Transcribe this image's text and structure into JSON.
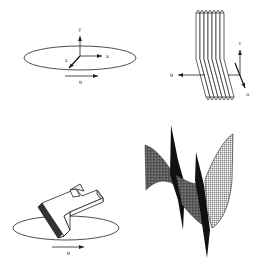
{
  "figure": {
    "panels": [
      {
        "id": "top-left",
        "description": "3D coordinate frame above a rotation ellipse",
        "axis_labels": {
          "x": "x",
          "y": "y",
          "z": "z"
        },
        "rotation_label": "θ"
      },
      {
        "id": "top-right",
        "description": "Stack of parallel slices with projection axes",
        "slice_count": 7,
        "axis_labels": {
          "theta": "θ",
          "v": "v",
          "u": "u"
        }
      },
      {
        "id": "bottom-left",
        "description": "L-shaped 3D object on rotation ellipse",
        "rotation_label": "θ"
      },
      {
        "id": "bottom-right",
        "description": "Wireframe mesh surface (sinogram-like)"
      }
    ],
    "colors": {
      "ink": "#222222",
      "background": "#ffffff"
    }
  }
}
